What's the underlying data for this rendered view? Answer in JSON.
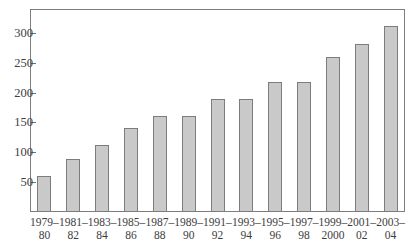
{
  "chart_data": {
    "type": "bar",
    "title": "",
    "subtitle": "",
    "xlabel": "",
    "ylabel": "",
    "grid": false,
    "legend": false,
    "ylim": [
      0,
      340
    ],
    "yticks": [
      50,
      100,
      150,
      200,
      250,
      300
    ],
    "ytick_labels": [
      "50",
      "100",
      "150",
      "200",
      "250",
      "300"
    ],
    "categories": [
      "1979–80",
      "1981–82",
      "1983–84",
      "1985–86",
      "1987–88",
      "1989–90",
      "1991–92",
      "1993–94",
      "1995–96",
      "1997–98",
      "1999–2000",
      "2001–02",
      "2003–04"
    ],
    "category_lines": [
      {
        "top": "1979–",
        "bottom": "80"
      },
      {
        "top": "1981–",
        "bottom": "82"
      },
      {
        "top": "1983–",
        "bottom": "84"
      },
      {
        "top": "1985–",
        "bottom": "86"
      },
      {
        "top": "1987–",
        "bottom": "88"
      },
      {
        "top": "1989–",
        "bottom": "90"
      },
      {
        "top": "1991–",
        "bottom": "92"
      },
      {
        "top": "1993–",
        "bottom": "94"
      },
      {
        "top": "1995–",
        "bottom": "96"
      },
      {
        "top": "1997–",
        "bottom": "98"
      },
      {
        "top": "1999–",
        "bottom": "2000"
      },
      {
        "top": "2001–",
        "bottom": "02"
      },
      {
        "top": "2003–",
        "bottom": "04"
      }
    ],
    "values": [
      61,
      88,
      113,
      141,
      160,
      160,
      189,
      189,
      218,
      218,
      259,
      281,
      311
    ],
    "colors": {
      "bar_fill": "#c9c9c9",
      "bar_border": "#7c7c7c",
      "frame": "#7d7d7d",
      "tick": "#6e6e6e",
      "text": "#3d3d3d",
      "background": "#ffffff"
    }
  }
}
